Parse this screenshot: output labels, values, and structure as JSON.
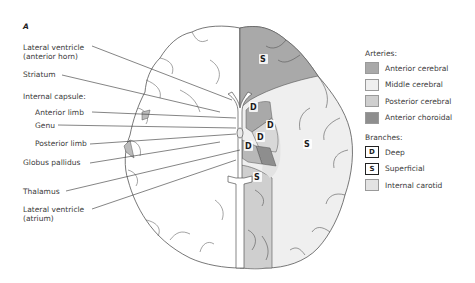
{
  "panel_letter": "A",
  "left_labels": [
    {
      "id": "lateral-ventricle-anterior-horn",
      "lines": [
        "Lateral ventricle",
        "(anterior horn)"
      ]
    },
    {
      "id": "striatum",
      "lines": [
        "Striatum"
      ]
    },
    {
      "id": "internal-capsule",
      "lines": [
        "Internal capsule:"
      ]
    },
    {
      "id": "anterior-limb",
      "lines": [
        "Anterior limb"
      ]
    },
    {
      "id": "genu",
      "lines": [
        "Genu"
      ]
    },
    {
      "id": "posterior-limb",
      "lines": [
        "Posterior limb"
      ]
    },
    {
      "id": "globus-pallidus",
      "lines": [
        "Globus pallidus"
      ]
    },
    {
      "id": "thalamus",
      "lines": [
        "Thalamus"
      ]
    },
    {
      "id": "lateral-ventricle-atrium",
      "lines": [
        "Lateral ventricle",
        "(atrium)"
      ]
    }
  ],
  "region_letters": {
    "superficial": "S",
    "deep": "D"
  },
  "legend": {
    "arteries_title": "Arteries:",
    "arteries": [
      {
        "label": "Anterior cerebral",
        "color": "#a9a9a9"
      },
      {
        "label": "Middle cerebral",
        "color": "#efefef"
      },
      {
        "label": "Posterior cerebral",
        "color": "#cfcfcf"
      },
      {
        "label": "Anterior choroidal",
        "color": "#8e8e8e"
      }
    ],
    "branches_title": "Branches:",
    "branches": [
      {
        "symbol": "D",
        "label": "Deep"
      },
      {
        "symbol": "S",
        "label": "Superficial"
      },
      {
        "symbol": "",
        "label": "Internal carotid",
        "color": "#e3e3e3"
      }
    ]
  },
  "colors": {
    "anterior_cerebral": "#a9a9a9",
    "middle_cerebral": "#efefef",
    "posterior_cerebral": "#cfcfcf",
    "anterior_choroidal": "#8e8e8e",
    "internal_carotid": "#e3e3e3",
    "outline": "#555555"
  }
}
